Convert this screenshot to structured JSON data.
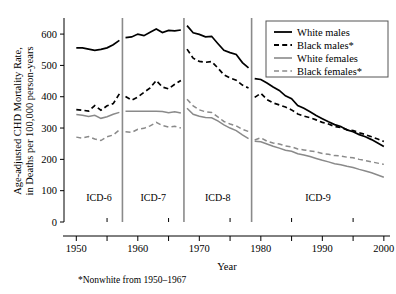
{
  "chart_data": {
    "type": "line",
    "title": "",
    "xlabel": "Year",
    "ylabel": "Age-adjusted CHD Mortality Rate,\nin Deaths per 100,000 person-years",
    "ylabel_line1": "Age-adjusted CHD Mortality Rate,",
    "ylabel_line2": "in Deaths per 100,000 person-years",
    "xlim": [
      1948,
      2001
    ],
    "ylim": [
      0,
      645
    ],
    "grid": false,
    "legend_position": "top-right",
    "y_ticks": [
      0,
      100,
      200,
      300,
      400,
      500,
      600
    ],
    "y_ticklabels": [
      "0",
      "100",
      "200",
      "300",
      "400",
      "500",
      "600"
    ],
    "x_ticks": [
      1950,
      1960,
      1970,
      1980,
      1990,
      2000
    ],
    "x_ticklabels": [
      "1950",
      "1960",
      "1970",
      "1980",
      "1990",
      "2000"
    ],
    "x_minor_ticks": [
      1955,
      1965,
      1975,
      1985,
      1995
    ],
    "footnote": "*Nonwhite from 1950–1967",
    "era_dividers": [
      1957.5,
      1967.5,
      1978.5
    ],
    "eras": [
      {
        "label": "ICD-6",
        "start": 1950,
        "end": 1957.5,
        "center": 1953.7
      },
      {
        "label": "ICD-7",
        "start": 1957.5,
        "end": 1967.5,
        "center": 1962.5
      },
      {
        "label": "ICD-8",
        "start": 1967.5,
        "end": 1978.5,
        "center": 1973.0
      },
      {
        "label": "ICD-9",
        "start": 1978.5,
        "end": 2000,
        "center": 1989.3
      }
    ],
    "legend": [
      {
        "name": "White males",
        "style": "solid",
        "color": "#000000"
      },
      {
        "name": "Black males*",
        "style": "dashed",
        "color": "#000000"
      },
      {
        "name": "White females",
        "style": "solid",
        "color": "#8a8a8a"
      },
      {
        "name": "Black females*",
        "style": "dashed",
        "color": "#8a8a8a"
      }
    ],
    "series": [
      {
        "name": "White males",
        "style": "solid",
        "color": "#000000",
        "segments": [
          {
            "era": "ICD-6",
            "x": [
              1950,
              1951,
              1952,
              1953,
              1954,
              1955,
              1956,
              1957
            ],
            "values": [
              556,
              556,
              552,
              548,
              551,
              556,
              566,
              580
            ]
          },
          {
            "era": "ICD-7",
            "x": [
              1958,
              1959,
              1960,
              1961,
              1962,
              1963,
              1964,
              1965,
              1966,
              1967
            ],
            "values": [
              589,
              591,
              600,
              595,
              606,
              616,
              605,
              612,
              610,
              613
            ]
          },
          {
            "era": "ICD-8",
            "x": [
              1968,
              1969,
              1970,
              1971,
              1972,
              1973,
              1974,
              1975,
              1976,
              1977,
              1978
            ],
            "values": [
              627,
              604,
              599,
              591,
              593,
              570,
              548,
              541,
              535,
              509,
              492
            ]
          },
          {
            "era": "ICD-9",
            "x": [
              1979,
              1980,
              1981,
              1982,
              1983,
              1984,
              1985,
              1986,
              1987,
              1988,
              1989,
              1990,
              1991,
              1992,
              1993,
              1994,
              1995,
              1996,
              1997,
              1998,
              1999,
              2000
            ],
            "values": [
              458,
              455,
              444,
              431,
              420,
              403,
              394,
              372,
              363,
              352,
              340,
              330,
              320,
              311,
              305,
              294,
              288,
              279,
              272,
              263,
              252,
              241
            ]
          }
        ]
      },
      {
        "name": "Black males*",
        "style": "dashed",
        "color": "#000000",
        "segments": [
          {
            "era": "ICD-6",
            "x": [
              1950,
              1951,
              1952,
              1953,
              1954,
              1955,
              1956,
              1957
            ],
            "values": [
              359,
              357,
              354,
              372,
              357,
              371,
              378,
              409
            ]
          },
          {
            "era": "ICD-7",
            "x": [
              1958,
              1959,
              1960,
              1961,
              1962,
              1963,
              1964,
              1965,
              1966,
              1967
            ],
            "values": [
              401,
              389,
              399,
              414,
              428,
              452,
              431,
              425,
              440,
              452
            ]
          },
          {
            "era": "ICD-8",
            "x": [
              1968,
              1969,
              1970,
              1971,
              1972,
              1973,
              1974,
              1975,
              1976,
              1977,
              1978
            ],
            "values": [
              552,
              523,
              513,
              510,
              512,
              492,
              470,
              460,
              453,
              437,
              428
            ]
          },
          {
            "era": "ICD-9",
            "x": [
              1979,
              1980,
              1981,
              1982,
              1983,
              1984,
              1985,
              1986,
              1987,
              1988,
              1989,
              1990,
              1991,
              1992,
              1993,
              1994,
              1995,
              1996,
              1997,
              1998,
              1999,
              2000
            ],
            "values": [
              398,
              411,
              391,
              380,
              374,
              367,
              358,
              345,
              338,
              333,
              326,
              318,
              313,
              305,
              302,
              295,
              292,
              285,
              279,
              272,
              265,
              257
            ]
          }
        ]
      },
      {
        "name": "White females",
        "style": "solid",
        "color": "#8a8a8a",
        "segments": [
          {
            "era": "ICD-6",
            "x": [
              1950,
              1951,
              1952,
              1953,
              1954,
              1955,
              1956,
              1957
            ],
            "values": [
              343,
              341,
              337,
              341,
              331,
              336,
              344,
              350
            ]
          },
          {
            "era": "ICD-7",
            "x": [
              1958,
              1959,
              1960,
              1961,
              1962,
              1963,
              1964,
              1965,
              1966,
              1967
            ],
            "values": [
              354,
              354,
              354,
              354,
              354,
              354,
              353,
              349,
              352,
              348
            ]
          },
          {
            "era": "ICD-8",
            "x": [
              1968,
              1969,
              1970,
              1971,
              1972,
              1973,
              1974,
              1975,
              1976,
              1977,
              1978
            ],
            "values": [
              363,
              344,
              338,
              334,
              333,
              323,
              310,
              300,
              292,
              278,
              266
            ]
          },
          {
            "era": "ICD-9",
            "x": [
              1979,
              1980,
              1981,
              1982,
              1983,
              1984,
              1985,
              1986,
              1987,
              1988,
              1989,
              1990,
              1991,
              1992,
              1993,
              1994,
              1995,
              1996,
              1997,
              1998,
              1999,
              2000
            ],
            "values": [
              258,
              256,
              249,
              242,
              236,
              229,
              226,
              218,
              214,
              209,
              203,
              197,
              192,
              186,
              183,
              178,
              174,
              168,
              163,
              157,
              150,
              143
            ]
          }
        ]
      },
      {
        "name": "Black females*",
        "style": "dashed",
        "color": "#8a8a8a",
        "segments": [
          {
            "era": "ICD-6",
            "x": [
              1950,
              1951,
              1952,
              1953,
              1954,
              1955,
              1956,
              1957
            ],
            "values": [
              271,
              268,
              273,
              265,
              260,
              272,
              278,
              294
            ]
          },
          {
            "era": "ICD-7",
            "x": [
              1958,
              1959,
              1960,
              1961,
              1962,
              1963,
              1964,
              1965,
              1966,
              1967
            ],
            "values": [
              288,
              286,
              296,
              299,
              307,
              318,
              308,
              303,
              306,
              300
            ]
          },
          {
            "era": "ICD-8",
            "x": [
              1968,
              1969,
              1970,
              1971,
              1972,
              1973,
              1974,
              1975,
              1976,
              1977,
              1978
            ],
            "values": [
              392,
              371,
              358,
              352,
              350,
              336,
              321,
              313,
              307,
              296,
              289
            ]
          },
          {
            "era": "ICD-9",
            "x": [
              1979,
              1980,
              1981,
              1982,
              1983,
              1984,
              1985,
              1986,
              1987,
              1988,
              1989,
              1990,
              1991,
              1992,
              1993,
              1994,
              1995,
              1996,
              1997,
              1998,
              1999,
              2000
            ],
            "values": [
              262,
              269,
              258,
              252,
              249,
              243,
              240,
              233,
              230,
              227,
              224,
              219,
              216,
              212,
              211,
              207,
              205,
              200,
              196,
              192,
              188,
              184
            ]
          }
        ]
      }
    ]
  }
}
